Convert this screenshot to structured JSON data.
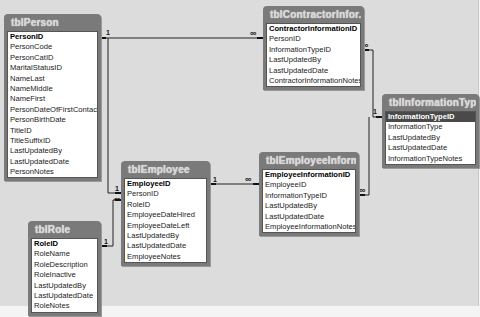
{
  "diagram": {
    "tables": [
      {
        "name": "tblPerson",
        "fields": [
          "PersonID",
          "PersonCode",
          "PersonCatID",
          "MaritalStatusID",
          "NameLast",
          "NameMiddle",
          "NameFirst",
          "PersonDateOfFirstContact",
          "PersonBirthDate",
          "TitleID",
          "TitleSuffixID",
          "LastUpdatedBy",
          "LastUpdatedDate",
          "PersonNotes"
        ],
        "primary_key": "PersonID"
      },
      {
        "name": "tblContractorInfor...",
        "fields": [
          "ContractorInformationID",
          "PersonID",
          "InformationTypeID",
          "LastUpdatedBy",
          "LastUpdatedDate",
          "ContractorInformationNotes"
        ],
        "primary_key": "ContractorInformationID"
      },
      {
        "name": "tblInformationType",
        "fields": [
          "InformationTypeID",
          "InformationType",
          "LastUpdatedBy",
          "LastUpdatedDate",
          "InformationTypeNotes"
        ],
        "primary_key": "InformationTypeID",
        "selected_field": "InformationTypeID"
      },
      {
        "name": "tblEmployee",
        "fields": [
          "EmployeeID",
          "PersonID",
          "RoleID",
          "EmployeeDateHired",
          "EmployeeDateLeft",
          "LastUpdatedBy",
          "LastUpdatedDate",
          "EmployeeNotes"
        ],
        "primary_key": "EmployeeID"
      },
      {
        "name": "tblEmployeeInforma...",
        "fields": [
          "EmployeeInformationID",
          "EmployeeID",
          "InformationTypeID",
          "LastUpdatedBy",
          "LastUpdatedDate",
          "EmployeeInformationNotes"
        ],
        "primary_key": "EmployeeInformationID"
      },
      {
        "name": "tblRole",
        "fields": [
          "RoleID",
          "RoleName",
          "RoleDescription",
          "RoleInactive",
          "LastUpdatedBy",
          "LastUpdatedDate",
          "RoleNotes"
        ],
        "primary_key": "RoleID"
      }
    ],
    "relationships": [
      {
        "from": "tblPerson.PersonID",
        "to": "tblContractorInformation.PersonID",
        "one": "1",
        "many": "∞"
      },
      {
        "from": "tblPerson.PersonID",
        "to": "tblEmployee.PersonID",
        "one": "1",
        "many": "∞"
      },
      {
        "from": "tblRole.RoleID",
        "to": "tblEmployee.RoleID",
        "one": "1",
        "many": "∞"
      },
      {
        "from": "tblEmployee.EmployeeID",
        "to": "tblEmployeeInformation.EmployeeID",
        "one": "1",
        "many": "∞"
      },
      {
        "from": "tblInformationType.InformationTypeID",
        "to": "tblContractorInformation.InformationTypeID",
        "one": "1",
        "many": "∞"
      },
      {
        "from": "tblInformationType.InformationTypeID",
        "to": "tblEmployeeInformation.InformationTypeID",
        "one": "1",
        "many": "∞"
      }
    ],
    "cardinality": {
      "one": "1",
      "many": "∞"
    },
    "colors": {
      "canvas": "#dcdcdc",
      "table_header": "#7a7a7a",
      "table_body": "#ffffff",
      "selected_row": "#4a4a4a",
      "line": "#222222"
    }
  }
}
